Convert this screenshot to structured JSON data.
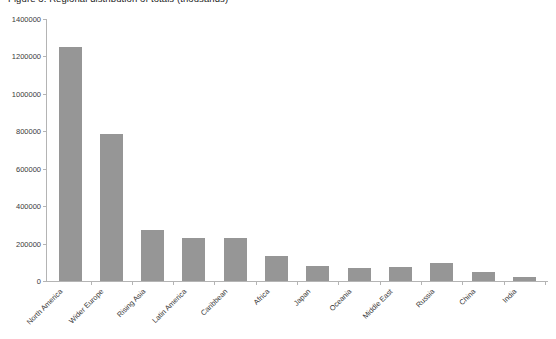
{
  "chart_data": {
    "type": "bar",
    "title": "Figure 3: Regional distribution of totals (thousands)",
    "xlabel": "",
    "ylabel": "",
    "grid": false,
    "legend": false,
    "ylim": [
      0,
      1400000
    ],
    "ytick_step": 200000,
    "ytick_labels": [
      "0",
      "200000",
      "400000",
      "600000",
      "800000",
      "1000000",
      "1200000",
      "1400000"
    ],
    "ytick_values": [
      0,
      200000,
      400000,
      600000,
      800000,
      1000000,
      1200000,
      1400000
    ],
    "categories": [
      "North America",
      "Wider Europe",
      "Rising Asia",
      "Latin America",
      "Caribbean",
      "Africa",
      "Japan",
      "Oceania",
      "Middle East",
      "Russia",
      "China",
      "India"
    ],
    "values": [
      1250000,
      785000,
      272000,
      230000,
      228000,
      135000,
      80000,
      70000,
      73000,
      95000,
      50000,
      22000
    ],
    "bar_color": "#969696",
    "axis_color": "#b4b4b4",
    "text_color": "#3a3a3a",
    "background_color": "#ffffff"
  }
}
